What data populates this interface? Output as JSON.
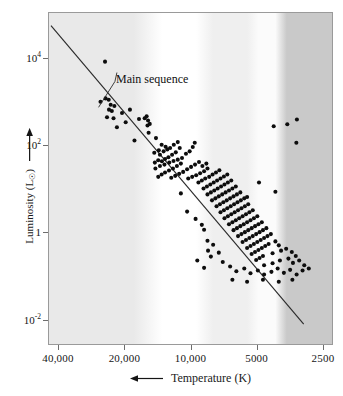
{
  "chart_data": {
    "type": "scatter",
    "title": "",
    "xlabel": "Temperature (K)",
    "ylabel": "Luminosity (L☉)",
    "xscale": "log-reversed",
    "yscale": "log",
    "xticks": [
      "40,000",
      "20,000",
      "10,000",
      "5000",
      "2500"
    ],
    "xtick_values": [
      40000,
      20000,
      10000,
      5000,
      2500
    ],
    "ytick_labels": [
      "10⁴",
      "10²",
      "1",
      "10⁻²"
    ],
    "ytick_values": [
      10000,
      100,
      1,
      0.01
    ],
    "xlim": [
      40000,
      2250
    ],
    "ylim": [
      0.004,
      60000
    ],
    "grid": false,
    "legend": "none",
    "annotations": [
      {
        "text": "Main sequence",
        "x_frac": 0.24,
        "y_frac": 0.18,
        "leader_to_x_frac": 0.175,
        "leader_to_y_frac": 0.285
      }
    ],
    "series": [
      {
        "name": "Main sequence fit line",
        "type": "line",
        "points_frac": [
          [
            0.007,
            0.038
          ],
          [
            0.9,
            0.94
          ]
        ]
      },
      {
        "name": "Stars",
        "type": "scatter",
        "marker": "filled-circle",
        "marker_color": "#0d0d0d",
        "marker_size_px": 4.1,
        "count": 214,
        "points_frac": [
          [
            0.198,
            0.147
          ],
          [
            0.182,
            0.268
          ],
          [
            0.2,
            0.258
          ],
          [
            0.211,
            0.262
          ],
          [
            0.218,
            0.277
          ],
          [
            0.212,
            0.292
          ],
          [
            0.222,
            0.296
          ],
          [
            0.231,
            0.281
          ],
          [
            0.205,
            0.315
          ],
          [
            0.228,
            0.318
          ],
          [
            0.258,
            0.302
          ],
          [
            0.271,
            0.33
          ],
          [
            0.286,
            0.292
          ],
          [
            0.24,
            0.345
          ],
          [
            0.318,
            0.32
          ],
          [
            0.338,
            0.318
          ],
          [
            0.345,
            0.312
          ],
          [
            0.35,
            0.325
          ],
          [
            0.348,
            0.34
          ],
          [
            0.356,
            0.335
          ],
          [
            0.352,
            0.362
          ],
          [
            0.378,
            0.378
          ],
          [
            0.302,
            0.385
          ],
          [
            0.398,
            0.398
          ],
          [
            0.412,
            0.404
          ],
          [
            0.388,
            0.415
          ],
          [
            0.405,
            0.418
          ],
          [
            0.372,
            0.422
          ],
          [
            0.392,
            0.428
          ],
          [
            0.418,
            0.412
          ],
          [
            0.428,
            0.408
          ],
          [
            0.441,
            0.398
          ],
          [
            0.455,
            0.39
          ],
          [
            0.462,
            0.408
          ],
          [
            0.448,
            0.421
          ],
          [
            0.435,
            0.428
          ],
          [
            0.422,
            0.436
          ],
          [
            0.41,
            0.441
          ],
          [
            0.399,
            0.448
          ],
          [
            0.386,
            0.445
          ],
          [
            0.374,
            0.452
          ],
          [
            0.392,
            0.462
          ],
          [
            0.408,
            0.458
          ],
          [
            0.425,
            0.452
          ],
          [
            0.44,
            0.447
          ],
          [
            0.455,
            0.443
          ],
          [
            0.47,
            0.438
          ],
          [
            0.484,
            0.425
          ],
          [
            0.497,
            0.418
          ],
          [
            0.508,
            0.405
          ],
          [
            0.515,
            0.392
          ],
          [
            0.466,
            0.455
          ],
          [
            0.452,
            0.462
          ],
          [
            0.438,
            0.47
          ],
          [
            0.424,
            0.476
          ],
          [
            0.41,
            0.482
          ],
          [
            0.398,
            0.488
          ],
          [
            0.386,
            0.495
          ],
          [
            0.376,
            0.47
          ],
          [
            0.432,
            0.498
          ],
          [
            0.446,
            0.492
          ],
          [
            0.46,
            0.486
          ],
          [
            0.474,
            0.48
          ],
          [
            0.488,
            0.472
          ],
          [
            0.502,
            0.465
          ],
          [
            0.516,
            0.458
          ],
          [
            0.53,
            0.45
          ],
          [
            0.492,
            0.5
          ],
          [
            0.506,
            0.495
          ],
          [
            0.52,
            0.49
          ],
          [
            0.534,
            0.484
          ],
          [
            0.548,
            0.478
          ],
          [
            0.56,
            0.47
          ],
          [
            0.542,
            0.462
          ],
          [
            0.556,
            0.455
          ],
          [
            0.528,
            0.512
          ],
          [
            0.54,
            0.506
          ],
          [
            0.552,
            0.5
          ],
          [
            0.566,
            0.495
          ],
          [
            0.578,
            0.488
          ],
          [
            0.59,
            0.482
          ],
          [
            0.602,
            0.475
          ],
          [
            0.546,
            0.53
          ],
          [
            0.558,
            0.524
          ],
          [
            0.57,
            0.518
          ],
          [
            0.582,
            0.512
          ],
          [
            0.594,
            0.506
          ],
          [
            0.606,
            0.5
          ],
          [
            0.618,
            0.494
          ],
          [
            0.63,
            0.488
          ],
          [
            0.56,
            0.548
          ],
          [
            0.572,
            0.542
          ],
          [
            0.584,
            0.536
          ],
          [
            0.596,
            0.53
          ],
          [
            0.608,
            0.524
          ],
          [
            0.62,
            0.518
          ],
          [
            0.632,
            0.512
          ],
          [
            0.644,
            0.506
          ],
          [
            0.576,
            0.566
          ],
          [
            0.588,
            0.56
          ],
          [
            0.6,
            0.554
          ],
          [
            0.612,
            0.548
          ],
          [
            0.624,
            0.542
          ],
          [
            0.636,
            0.536
          ],
          [
            0.648,
            0.53
          ],
          [
            0.66,
            0.524
          ],
          [
            0.592,
            0.584
          ],
          [
            0.604,
            0.578
          ],
          [
            0.616,
            0.572
          ],
          [
            0.628,
            0.566
          ],
          [
            0.64,
            0.56
          ],
          [
            0.652,
            0.554
          ],
          [
            0.664,
            0.548
          ],
          [
            0.676,
            0.542
          ],
          [
            0.606,
            0.602
          ],
          [
            0.618,
            0.596
          ],
          [
            0.63,
            0.59
          ],
          [
            0.642,
            0.584
          ],
          [
            0.654,
            0.578
          ],
          [
            0.666,
            0.572
          ],
          [
            0.678,
            0.566
          ],
          [
            0.69,
            0.56
          ],
          [
            0.62,
            0.62
          ],
          [
            0.632,
            0.614
          ],
          [
            0.644,
            0.608
          ],
          [
            0.656,
            0.602
          ],
          [
            0.668,
            0.596
          ],
          [
            0.68,
            0.59
          ],
          [
            0.692,
            0.584
          ],
          [
            0.704,
            0.578
          ],
          [
            0.636,
            0.638
          ],
          [
            0.648,
            0.632
          ],
          [
            0.66,
            0.626
          ],
          [
            0.672,
            0.62
          ],
          [
            0.684,
            0.614
          ],
          [
            0.696,
            0.608
          ],
          [
            0.708,
            0.602
          ],
          [
            0.72,
            0.596
          ],
          [
            0.652,
            0.656
          ],
          [
            0.664,
            0.65
          ],
          [
            0.676,
            0.644
          ],
          [
            0.688,
            0.638
          ],
          [
            0.7,
            0.632
          ],
          [
            0.712,
            0.626
          ],
          [
            0.724,
            0.62
          ],
          [
            0.736,
            0.614
          ],
          [
            0.668,
            0.674
          ],
          [
            0.68,
            0.668
          ],
          [
            0.692,
            0.662
          ],
          [
            0.704,
            0.656
          ],
          [
            0.716,
            0.65
          ],
          [
            0.728,
            0.644
          ],
          [
            0.74,
            0.638
          ],
          [
            0.752,
            0.632
          ],
          [
            0.684,
            0.692
          ],
          [
            0.696,
            0.686
          ],
          [
            0.708,
            0.68
          ],
          [
            0.72,
            0.674
          ],
          [
            0.732,
            0.668
          ],
          [
            0.744,
            0.662
          ],
          [
            0.756,
            0.656
          ],
          [
            0.768,
            0.65
          ],
          [
            0.7,
            0.71
          ],
          [
            0.712,
            0.704
          ],
          [
            0.724,
            0.698
          ],
          [
            0.736,
            0.692
          ],
          [
            0.748,
            0.686
          ],
          [
            0.76,
            0.68
          ],
          [
            0.772,
            0.674
          ],
          [
            0.784,
            0.668
          ],
          [
            0.716,
            0.728
          ],
          [
            0.728,
            0.722
          ],
          [
            0.74,
            0.716
          ],
          [
            0.752,
            0.71
          ],
          [
            0.764,
            0.704
          ],
          [
            0.776,
            0.698
          ],
          [
            0.8,
            0.69
          ],
          [
            0.812,
            0.702
          ],
          [
            0.732,
            0.746
          ],
          [
            0.744,
            0.74
          ],
          [
            0.756,
            0.734
          ],
          [
            0.79,
            0.726
          ],
          [
            0.82,
            0.718
          ],
          [
            0.838,
            0.712
          ],
          [
            0.858,
            0.722
          ],
          [
            0.872,
            0.734
          ],
          [
            0.76,
            0.762
          ],
          [
            0.79,
            0.756
          ],
          [
            0.816,
            0.748
          ],
          [
            0.846,
            0.742
          ],
          [
            0.862,
            0.755
          ],
          [
            0.884,
            0.748
          ],
          [
            0.902,
            0.762
          ],
          [
            0.548,
            0.655
          ],
          [
            0.58,
            0.7
          ],
          [
            0.562,
            0.718
          ],
          [
            0.572,
            0.736
          ],
          [
            0.6,
            0.724
          ],
          [
            0.548,
            0.77
          ],
          [
            0.614,
            0.752
          ],
          [
            0.64,
            0.766
          ],
          [
            0.662,
            0.78
          ],
          [
            0.69,
            0.772
          ],
          [
            0.712,
            0.786
          ],
          [
            0.738,
            0.778
          ],
          [
            0.76,
            0.79
          ],
          [
            0.786,
            0.782
          ],
          [
            0.808,
            0.772
          ],
          [
            0.83,
            0.785
          ],
          [
            0.852,
            0.776
          ],
          [
            0.875,
            0.79
          ],
          [
            0.896,
            0.778
          ],
          [
            0.918,
            0.772
          ],
          [
            0.7,
            0.556
          ],
          [
            0.742,
            0.512
          ],
          [
            0.794,
            0.342
          ],
          [
            0.842,
            0.336
          ],
          [
            0.876,
            0.322
          ],
          [
            0.874,
            0.392
          ],
          [
            0.8,
            0.54
          ],
          [
            0.466,
            0.545
          ],
          [
            0.488,
            0.6
          ],
          [
            0.518,
            0.622
          ],
          [
            0.54,
            0.64
          ],
          [
            0.56,
            0.688
          ],
          [
            0.524,
            0.748
          ],
          [
            0.648,
            0.806
          ],
          [
            0.7,
            0.812
          ],
          [
            0.756,
            0.806
          ],
          [
            0.812,
            0.812
          ],
          [
            0.86,
            0.806
          ]
        ]
      }
    ],
    "background_bands": [
      {
        "name": "hot-blue-band",
        "start_frac": 0.0,
        "end_frac": 0.3,
        "color": "#e9e9e9"
      },
      {
        "name": "white-band",
        "start_frac": 0.4,
        "end_frac": 0.52,
        "color": "#ffffff"
      },
      {
        "name": "yellow-band",
        "start_frac": 0.58,
        "end_frac": 0.7,
        "color": "#efefef"
      },
      {
        "name": "orange-band",
        "start_frac": 0.74,
        "end_frac": 0.8,
        "color": "#fbfbfb"
      },
      {
        "name": "cool-red-band",
        "start_frac": 0.84,
        "end_frac": 1.0,
        "color": "#c9c9c9"
      }
    ]
  },
  "axes": {
    "x": {
      "title": "Temperature (K)",
      "arrow": "left-arrow-icon",
      "ticks": [
        {
          "label": "40,000",
          "pos_frac": 0.035
        },
        {
          "label": "20,000",
          "pos_frac": 0.268
        },
        {
          "label": "10,000",
          "pos_frac": 0.5
        },
        {
          "label": "5000",
          "pos_frac": 0.732
        },
        {
          "label": "2500",
          "pos_frac": 0.965
        }
      ]
    },
    "y": {
      "title_prefix": "Luminosity (L",
      "title_sub": "☉",
      "title_suffix": ")",
      "arrow": "up-arrow-icon",
      "ticks": [
        {
          "mantissa": "10",
          "exponent": "4",
          "plain": "10⁴",
          "pos_frac": 0.138
        },
        {
          "mantissa": "10",
          "exponent": "2",
          "plain": "10²",
          "pos_frac": 0.4
        },
        {
          "mantissa": "1",
          "exponent": "",
          "plain": "1",
          "pos_frac": 0.661
        },
        {
          "mantissa": "10",
          "exponent": "-2",
          "plain": "10⁻²",
          "pos_frac": 0.925
        }
      ]
    }
  },
  "annotation": {
    "main_sequence_label": "Main sequence"
  },
  "colors": {
    "marker": "#0d0d0d",
    "line": "#2b2b2b",
    "frame": "#9a9a9a",
    "tick": "#6d6d6d",
    "text": "#151515"
  }
}
